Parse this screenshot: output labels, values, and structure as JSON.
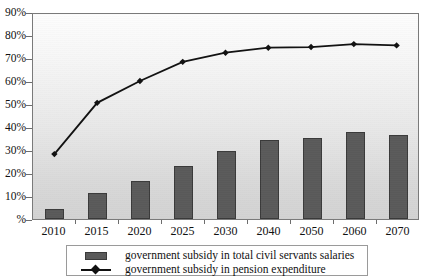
{
  "chart_data": {
    "type": "bar",
    "title": "",
    "subtitle": "",
    "xlabel": "",
    "ylabel": "",
    "categories": [
      "2010",
      "2015",
      "2020",
      "2025",
      "2030",
      "2040",
      "2050",
      "2060",
      "2070"
    ],
    "ylim": [
      0,
      90
    ],
    "y_ticks": [
      0,
      10,
      20,
      30,
      40,
      50,
      60,
      70,
      80,
      90
    ],
    "y_tick_labels": [
      "%",
      "10%",
      "20%",
      "30%",
      "40%",
      "50%",
      "60%",
      "70%",
      "80%",
      "90%"
    ],
    "grid": false,
    "legend_position": "bottom",
    "series": [
      {
        "name": "government subsidy in total civil servants salaries",
        "type": "bar",
        "color": "#5a5a5a",
        "values": [
          4.3,
          11.2,
          16.7,
          23.2,
          29.7,
          34.2,
          35.3,
          37.7,
          36.5
        ]
      },
      {
        "name": "government subsidy in pension expenditure",
        "type": "line",
        "color": "#111111",
        "marker": "diamond",
        "values": [
          28.5,
          51.0,
          60.6,
          69.0,
          73.0,
          75.2,
          75.5,
          76.8,
          76.2
        ]
      }
    ]
  },
  "legend": {
    "items": [
      {
        "label": "government subsidy in total civil servants salaries",
        "key": "bar-swatch"
      },
      {
        "label": "government subsidy in pension expenditure",
        "key": "line-marker"
      }
    ]
  }
}
